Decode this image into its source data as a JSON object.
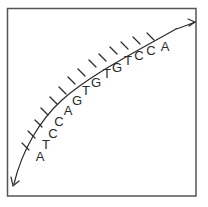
{
  "diagram": {
    "sequence": "ATCCAGTGTGTCCA",
    "bases": [
      {
        "label": "A",
        "x": 40,
        "y": 161,
        "tick": [
          22,
          151,
          30,
          154
        ]
      },
      {
        "label": "T",
        "x": 46,
        "y": 149,
        "tick": [
          28,
          139,
          36,
          143
        ]
      },
      {
        "label": "C",
        "x": 53,
        "y": 138,
        "tick": [
          35,
          128,
          42,
          133
        ]
      },
      {
        "label": "C",
        "x": 59,
        "y": 126,
        "tick": [
          42,
          118,
          49,
          123
        ]
      },
      {
        "label": "A",
        "x": 68,
        "y": 115,
        "tick": [
          50,
          108,
          56,
          114
        ]
      },
      {
        "label": "G",
        "x": 77,
        "y": 105,
        "tick": [
          58,
          99,
          64,
          105
        ]
      },
      {
        "label": "T",
        "x": 86,
        "y": 95,
        "tick": [
          68,
          90,
          73,
          97
        ]
      },
      {
        "label": "G",
        "x": 96,
        "y": 87,
        "tick": [
          78,
          82,
          82,
          89
        ]
      },
      {
        "label": "T",
        "x": 107,
        "y": 78,
        "tick": [
          88,
          75,
          92,
          82
        ]
      },
      {
        "label": "G",
        "x": 117,
        "y": 72,
        "tick": [
          99,
          68,
          102,
          75
        ]
      },
      {
        "label": "T",
        "x": 128,
        "y": 65,
        "tick": [
          110,
          61,
          112,
          68
        ]
      },
      {
        "label": "C",
        "x": 139,
        "y": 60,
        "tick": [
          121,
          55,
          123,
          62
        ]
      },
      {
        "label": "C",
        "x": 151,
        "y": 55,
        "tick": [
          133,
          50,
          134,
          57
        ]
      },
      {
        "label": "A",
        "x": 165,
        "y": 51,
        "tick": [
          145,
          45,
          146,
          52
        ]
      }
    ],
    "colors": {
      "ink": "#2a2a2a",
      "frame": "#555555",
      "background": "#ffffff"
    }
  }
}
